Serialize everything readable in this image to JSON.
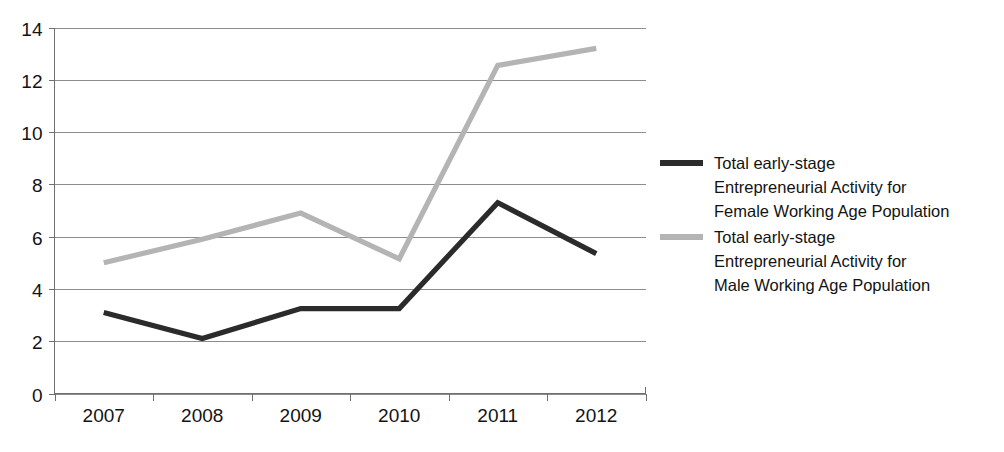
{
  "chart_data": {
    "type": "line",
    "title": "",
    "subtitle": "",
    "xlabel": "",
    "ylabel": "",
    "categories": [
      "2007",
      "2008",
      "2009",
      "2010",
      "2011",
      "2012"
    ],
    "ylim": [
      0,
      14
    ],
    "ytick_values": [
      0,
      2,
      4,
      6,
      8,
      10,
      12,
      14
    ],
    "ytick_labels": [
      "0",
      "2",
      "4",
      "6",
      "8",
      "10",
      "12",
      "14"
    ],
    "grid": "horizontal",
    "legend_position": "right",
    "series": [
      {
        "name": "Total early-stage Entrepreneurial Activity for Female Working Age Population",
        "color": "#2b2b2b",
        "line_width": 5.2,
        "values": [
          3.1,
          2.1,
          3.25,
          3.25,
          7.3,
          5.35
        ]
      },
      {
        "name": "Total early-stage Entrepreneurial Activity for Male Working Age Population",
        "color": "#b4b4b4",
        "line_width": 5.2,
        "values": [
          5.0,
          5.9,
          6.9,
          5.15,
          12.55,
          13.2
        ]
      }
    ]
  },
  "legend": {
    "entries": [
      {
        "line1": "Total early-stage",
        "line2": "Entrepreneurial Activity for",
        "line3": "Female Working Age Population",
        "color": "#2b2b2b"
      },
      {
        "line1": "Total early-stage",
        "line2": "Entrepreneurial Activity for",
        "line3": "Male Working Age Population",
        "color": "#b4b4b4"
      }
    ]
  },
  "axes": {
    "y_axis_name": "value-axis",
    "x_axis_name": "year-axis"
  }
}
